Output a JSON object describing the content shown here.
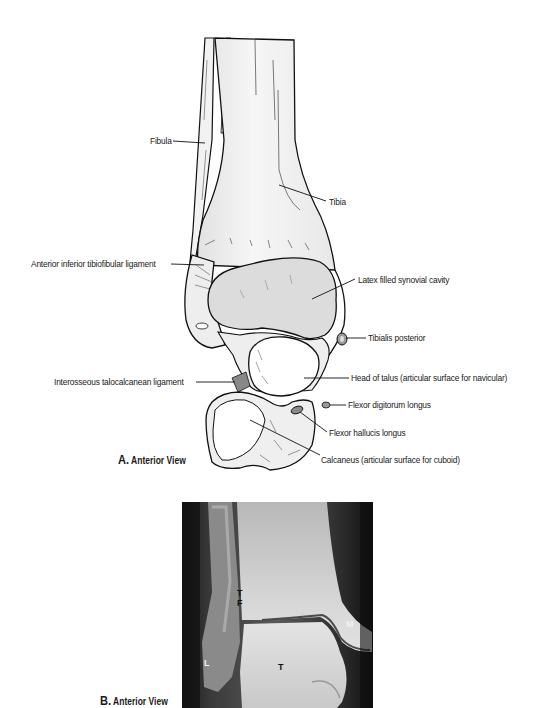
{
  "figure": {
    "panel_a": {
      "caption_letter": "A.",
      "caption_text": "Anterior View",
      "labels": {
        "fibula": "Fibula",
        "tibia": "Tibia",
        "anterior_inferior_tibiofibular_ligament": "Anterior inferior tibiofibular ligament",
        "latex_filled_synovial_cavity": "Latex filled  synovial cavity",
        "tibialis_posterior": "Tibialis posterior",
        "interosseous_talocalcanean_ligament": "Interosseous talocalcanean ligament",
        "head_of_talus": "Head of talus (articular surface for navicular)",
        "flexor_digitorum_longus": "Flexor digitorum longus",
        "flexor_hallucis_longus": "Flexor hallucis longus",
        "calcaneus": "Calcaneus (articular surface for cuboid)"
      }
    },
    "panel_b": {
      "caption_letter": "B.",
      "caption_text": "Anterior View",
      "xray_labels": {
        "tf_top": "T",
        "tf_bottom": "F",
        "medial": "M",
        "lateral": "L",
        "talus": "T"
      }
    }
  }
}
